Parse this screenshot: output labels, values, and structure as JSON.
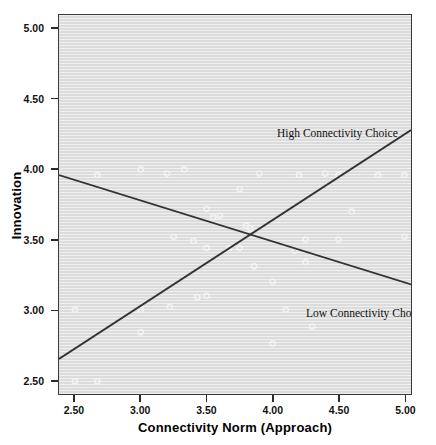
{
  "chart_data": {
    "type": "scatter",
    "title": "",
    "xlabel": "Connectivity Norm (Approach)",
    "ylabel": "Innovation",
    "xlim": [
      2.38,
      5.05
    ],
    "ylim": [
      2.4,
      5.1
    ],
    "xticks": [
      "2.50",
      "3.00",
      "3.50",
      "4.00",
      "4.50",
      "5.00"
    ],
    "xtick_values": [
      2.5,
      3.0,
      3.5,
      4.0,
      4.5,
      5.0
    ],
    "yticks": [
      "2.50",
      "3.00",
      "3.50",
      "4.00",
      "4.50",
      "5.00"
    ],
    "ytick_values": [
      2.5,
      3.0,
      3.5,
      4.0,
      4.5,
      5.0
    ],
    "grid": false,
    "legend_position": "in-plot annotations",
    "annotations": [
      {
        "id": "high",
        "text": "High Connectivity Choice",
        "x": 4.3,
        "y": 4.3
      },
      {
        "id": "low",
        "text": "Low Connectivity Choice",
        "x": 4.35,
        "y": 2.98
      }
    ],
    "series": [
      {
        "name": "High Connectivity Choice",
        "type": "line",
        "slope_sign": "positive",
        "color": "#333333",
        "endpoints": [
          {
            "x": 2.38,
            "y": 2.65
          },
          {
            "x": 5.05,
            "y": 4.28
          }
        ]
      },
      {
        "name": "Low Connectivity Choice",
        "type": "line",
        "slope_sign": "negative",
        "color": "#333333",
        "endpoints": [
          {
            "x": 2.38,
            "y": 3.96
          },
          {
            "x": 5.05,
            "y": 3.18
          }
        ]
      }
    ],
    "intersection": {
      "x": 3.9,
      "y": 3.55
    },
    "scatter": {
      "name": "Observations",
      "marker": "open-circle",
      "marker_color": "#f2f2f2",
      "points": [
        {
          "x": 2.5,
          "y": 3.0
        },
        {
          "x": 2.5,
          "y": 2.49
        },
        {
          "x": 2.67,
          "y": 2.49
        },
        {
          "x": 2.67,
          "y": 3.96
        },
        {
          "x": 3.0,
          "y": 4.0
        },
        {
          "x": 3.0,
          "y": 3.0
        },
        {
          "x": 3.0,
          "y": 2.84
        },
        {
          "x": 3.2,
          "y": 3.97
        },
        {
          "x": 3.22,
          "y": 3.02
        },
        {
          "x": 3.25,
          "y": 3.52
        },
        {
          "x": 3.33,
          "y": 4.0
        },
        {
          "x": 3.4,
          "y": 3.49
        },
        {
          "x": 3.43,
          "y": 3.09
        },
        {
          "x": 3.5,
          "y": 3.72
        },
        {
          "x": 3.5,
          "y": 3.44
        },
        {
          "x": 3.5,
          "y": 3.1
        },
        {
          "x": 3.55,
          "y": 3.66
        },
        {
          "x": 3.6,
          "y": 3.67
        },
        {
          "x": 3.67,
          "y": 3.44
        },
        {
          "x": 3.75,
          "y": 3.44
        },
        {
          "x": 3.75,
          "y": 3.86
        },
        {
          "x": 3.8,
          "y": 3.6
        },
        {
          "x": 3.83,
          "y": 3.58
        },
        {
          "x": 3.86,
          "y": 3.31
        },
        {
          "x": 3.9,
          "y": 3.97
        },
        {
          "x": 4.0,
          "y": 3.2
        },
        {
          "x": 4.0,
          "y": 2.76
        },
        {
          "x": 4.1,
          "y": 3.0
        },
        {
          "x": 4.17,
          "y": 3.42
        },
        {
          "x": 4.2,
          "y": 3.96
        },
        {
          "x": 4.25,
          "y": 3.34
        },
        {
          "x": 4.25,
          "y": 3.5
        },
        {
          "x": 4.3,
          "y": 2.88
        },
        {
          "x": 4.4,
          "y": 3.97
        },
        {
          "x": 4.5,
          "y": 3.5
        },
        {
          "x": 4.5,
          "y": 3.96
        },
        {
          "x": 4.6,
          "y": 3.7
        },
        {
          "x": 4.8,
          "y": 3.96
        },
        {
          "x": 5.0,
          "y": 3.96
        },
        {
          "x": 5.0,
          "y": 3.52
        }
      ]
    }
  }
}
